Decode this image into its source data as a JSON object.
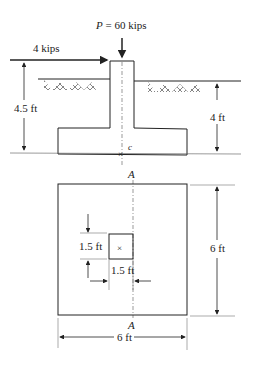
{
  "elevation": {
    "axial_load_label_var": "P",
    "axial_load_label_value": " = 60 kips",
    "lateral_load_label": "4 kips",
    "height_left_label": "4.5 ft",
    "depth_right_label": "4 ft",
    "centroid_label": "c"
  },
  "plan": {
    "section_label_top": "A",
    "section_label_bottom": "A",
    "column_height_label": "1.5 ft",
    "column_width_label": "1.5 ft",
    "footing_height_label": "6 ft",
    "footing_width_label": "6 ft",
    "center_mark": "×"
  },
  "colors": {
    "line": "#222222",
    "background": "#ffffff"
  }
}
